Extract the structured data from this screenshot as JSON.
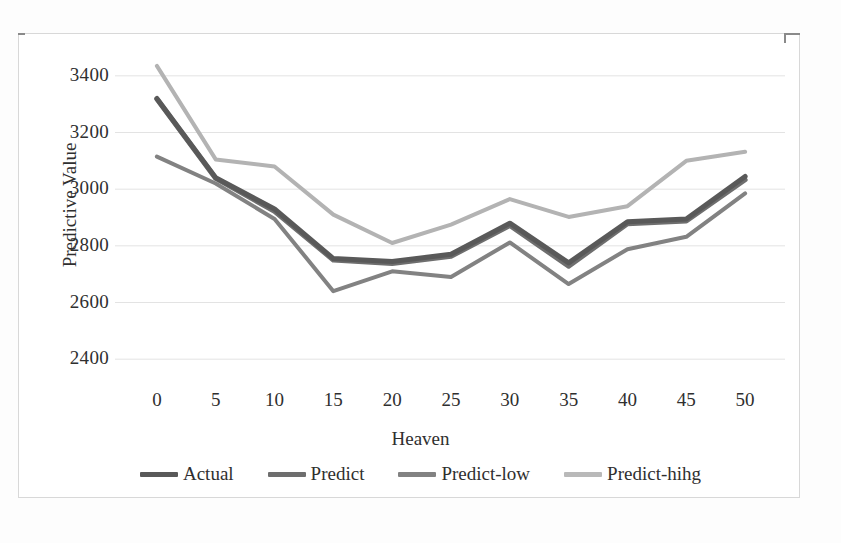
{
  "chart_data": {
    "type": "line",
    "title": "",
    "xlabel": "Heaven",
    "ylabel": "Predictive Value",
    "x": [
      0,
      5,
      10,
      15,
      20,
      25,
      30,
      35,
      40,
      45,
      50
    ],
    "xticklabels": [
      "0",
      "5",
      "10",
      "15",
      "20",
      "25",
      "30",
      "35",
      "40",
      "45",
      "50"
    ],
    "yticklabels": [
      "2400",
      "2600",
      "2800",
      "3000",
      "3200",
      "3400"
    ],
    "yticks": [
      2400,
      2600,
      2800,
      3000,
      3200,
      3400
    ],
    "ylim": [
      2330,
      3470
    ],
    "xlim": [
      -2.2,
      52.2
    ],
    "grid": "horizontal",
    "legend_position": "bottom",
    "series": [
      {
        "name": "Actual",
        "color": "#595959",
        "width": 5,
        "values": [
          3320,
          3040,
          2930,
          2755,
          2745,
          2770,
          2880,
          2740,
          2885,
          2895,
          3045
        ]
      },
      {
        "name": "Predict",
        "color": "#6e6e6e",
        "width": 5,
        "values": [
          3318,
          3038,
          2922,
          2750,
          2738,
          2763,
          2872,
          2728,
          2878,
          2888,
          3033
        ]
      },
      {
        "name": "Predict-low",
        "color": "#828282",
        "width": 4,
        "values": [
          3115,
          3020,
          2895,
          2640,
          2710,
          2690,
          2812,
          2665,
          2788,
          2832,
          2985
        ]
      },
      {
        "name": "Predict-hihg",
        "color": "#b3b3b3",
        "width": 4,
        "values": [
          3435,
          3105,
          3080,
          2910,
          2810,
          2875,
          2965,
          2902,
          2940,
          3100,
          3132
        ]
      }
    ]
  },
  "axes": {
    "y_title": "Predictive Value",
    "x_title": "Heaven"
  },
  "legend": {
    "items": [
      {
        "label": "Actual",
        "color": "#595959"
      },
      {
        "label": "Predict",
        "color": "#6e6e6e"
      },
      {
        "label": "Predict-low",
        "color": "#828282"
      },
      {
        "label": "Predict-hihg",
        "color": "#b9b9b9"
      }
    ]
  },
  "colors": {
    "grid": "#e3e3e3",
    "text": "#2f2f2f",
    "frame": "#d8d8d8",
    "background": "#ffffff"
  }
}
